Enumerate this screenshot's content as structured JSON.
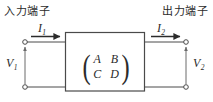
{
  "figure": {
    "type": "two-port-network-diagram",
    "background_color": "#ffffff",
    "line_color": "#4a4a4a",
    "text_color": "#2b2b2b"
  },
  "labels": {
    "input_terminal": "入力端子",
    "output_terminal": "出力端子"
  },
  "currents": {
    "i1": {
      "symbol": "I",
      "subscript": "1"
    },
    "i2": {
      "symbol": "I",
      "subscript": "2"
    }
  },
  "voltages": {
    "v1": {
      "symbol": "V",
      "subscript": "1"
    },
    "v2": {
      "symbol": "V",
      "subscript": "2"
    }
  },
  "matrix": {
    "rows": [
      [
        "A",
        "B"
      ],
      [
        "C",
        "D"
      ]
    ],
    "left_paren": "(",
    "right_paren": ")"
  }
}
